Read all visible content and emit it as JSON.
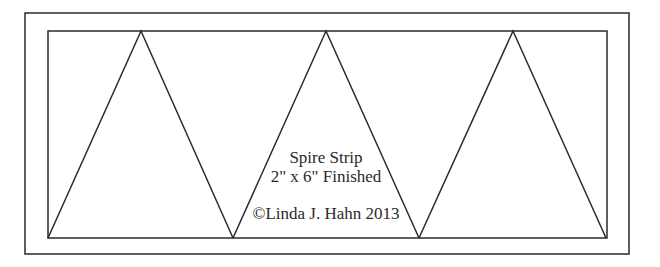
{
  "diagram": {
    "title": "Spire Strip",
    "size_label": "2\" x 6\" Finished",
    "copyright": "©Linda J. Hahn 2013",
    "line_color": "#2a2a2a",
    "outer_border": {
      "x1": 25,
      "y1": 13,
      "x2": 629,
      "y2": 254
    },
    "inner_border": {
      "x1": 48,
      "y1": 31,
      "x2": 607,
      "y2": 238
    },
    "triangles": [
      {
        "apex": [
          141,
          31
        ],
        "base": [
          [
            48,
            238
          ],
          [
            233,
            238
          ]
        ]
      },
      {
        "apex": [
          326,
          31
        ],
        "base": [
          [
            233,
            238
          ],
          [
            419,
            238
          ]
        ]
      },
      {
        "apex": [
          513,
          31
        ],
        "base": [
          [
            419,
            238
          ],
          [
            606,
            238
          ]
        ]
      }
    ]
  }
}
